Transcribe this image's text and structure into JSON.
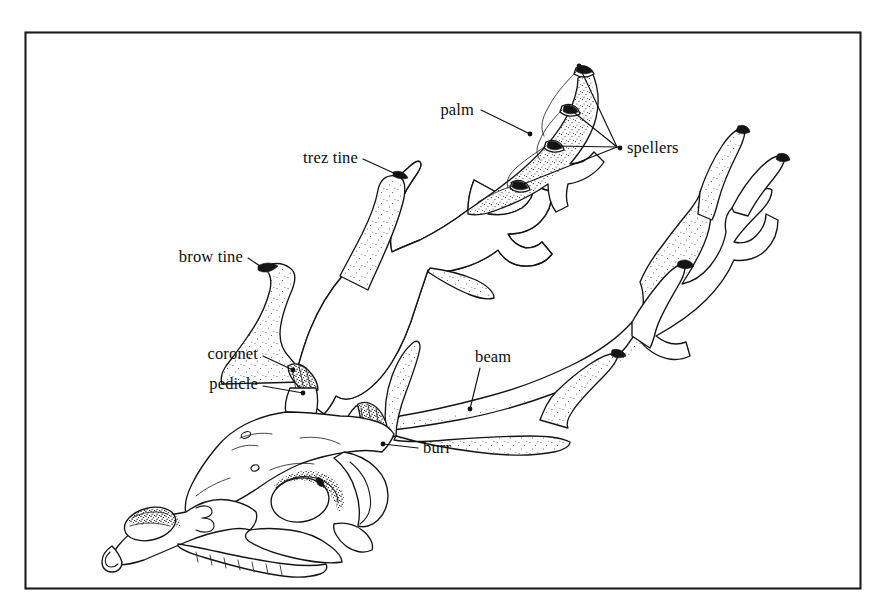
{
  "figure": {
    "kind": "line-drawing",
    "background_color": "#ffffff",
    "ink_color": "#111111",
    "frame": {
      "present": true,
      "stroke_color": "#1c1c1c",
      "x": 25,
      "y": 32,
      "width": 835,
      "height": 556
    }
  },
  "labels": [
    {
      "id": "palm",
      "text": "palm",
      "text_x": 474,
      "text_y": 115,
      "anchor": "end",
      "leader": [
        [
          481,
          110
        ],
        [
          530,
          134
        ]
      ],
      "dot": [
        530,
        134
      ]
    },
    {
      "id": "spellers",
      "text": "spellers",
      "text_x": 627,
      "text_y": 153,
      "anchor": "start",
      "leader": [
        [
          620,
          148
        ],
        [
          620,
          148
        ]
      ],
      "dot": [
        620,
        148
      ]
    },
    {
      "id": "trez-tine",
      "text": "trez tine",
      "text_x": 358,
      "text_y": 163,
      "anchor": "end",
      "leader": [
        [
          363,
          159
        ],
        [
          398,
          175
        ]
      ],
      "dot": [
        398,
        175
      ]
    },
    {
      "id": "brow-tine",
      "text": "brow tine",
      "text_x": 243,
      "text_y": 262,
      "anchor": "end",
      "leader": [
        [
          248,
          258
        ],
        [
          263,
          268
        ]
      ],
      "dot": [
        263,
        268
      ]
    },
    {
      "id": "coronet",
      "text": "coronet",
      "text_x": 258,
      "text_y": 359,
      "anchor": "end",
      "leader": [
        [
          263,
          356
        ],
        [
          293,
          370
        ]
      ],
      "dot": [
        293,
        370
      ]
    },
    {
      "id": "pedicle",
      "text": "pedicle",
      "text_x": 258,
      "text_y": 389,
      "anchor": "end",
      "leader": [
        [
          263,
          386
        ],
        [
          303,
          393
        ]
      ],
      "dot": [
        303,
        393
      ]
    },
    {
      "id": "beam",
      "text": "beam",
      "text_x": 475,
      "text_y": 362,
      "anchor": "start",
      "leader": [
        [
          480,
          368
        ],
        [
          470,
          409
        ]
      ],
      "dot": [
        470,
        409
      ]
    },
    {
      "id": "burr",
      "text": "burr",
      "text_x": 423,
      "text_y": 453,
      "anchor": "start",
      "leader": [
        [
          418,
          448
        ],
        [
          383,
          444
        ]
      ],
      "dot": [
        383,
        444
      ]
    }
  ],
  "spellers_leaders": [
    {
      "id": "speller-leader-top",
      "from": [
        617,
        147
      ],
      "to": [
        579,
        66
      ]
    },
    {
      "id": "speller-leader-mid",
      "from": [
        617,
        147
      ],
      "to": [
        571,
        110
      ]
    },
    {
      "id": "speller-leader-low",
      "from": [
        617,
        147
      ],
      "to": [
        555,
        146
      ]
    },
    {
      "id": "speller-leader-bottom",
      "from": [
        617,
        147
      ],
      "to": [
        521,
        185
      ]
    }
  ],
  "speller_tips": [
    {
      "id": "speller-tip-1",
      "x": 579,
      "y": 66
    },
    {
      "id": "speller-tip-2",
      "x": 571,
      "y": 110
    },
    {
      "id": "speller-tip-3",
      "x": 555,
      "y": 146
    },
    {
      "id": "speller-tip-4",
      "x": 521,
      "y": 185
    }
  ],
  "anatomy_parts": [
    {
      "id": "skull",
      "name": "skull"
    },
    {
      "id": "left-antler",
      "name": "left antler"
    },
    {
      "id": "right-antler",
      "name": "right antler"
    },
    {
      "id": "palm-region",
      "name": "palm"
    },
    {
      "id": "brow-tine-part",
      "name": "brow tine"
    },
    {
      "id": "trez-tine-part",
      "name": "trez tine"
    },
    {
      "id": "beam-part",
      "name": "beam"
    },
    {
      "id": "burr-part",
      "name": "burr"
    },
    {
      "id": "coronet-part",
      "name": "coronet"
    },
    {
      "id": "pedicle-part",
      "name": "pedicle"
    },
    {
      "id": "eye-socket",
      "name": "orbit"
    },
    {
      "id": "nasal-opening",
      "name": "nasal opening"
    },
    {
      "id": "mandible",
      "name": "mandible"
    }
  ]
}
